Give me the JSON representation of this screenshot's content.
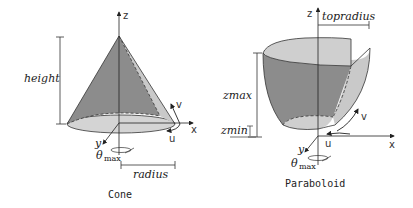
{
  "cone": {
    "title": "Cone",
    "labels": {
      "height": "height",
      "radius": "radius",
      "z": "z",
      "x": "x",
      "y": "y",
      "u": "u",
      "v": "v",
      "theta": "θ",
      "theta_sub": "max"
    }
  },
  "paraboloid": {
    "title": "Paraboloid",
    "labels": {
      "topradius": "topradius",
      "zmax": "zmax",
      "zmin": "zmin",
      "z": "z",
      "x": "x",
      "y": "y",
      "u": "u",
      "v": "v",
      "theta": "θ",
      "theta_sub": "max"
    }
  },
  "colors": {
    "surface_dark": "#8c8c8c",
    "surface_light": "#c8c8c8",
    "surface_lighter": "#d6d6d6",
    "line": "#222222"
  }
}
